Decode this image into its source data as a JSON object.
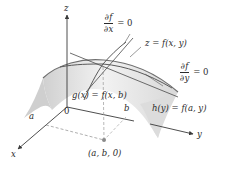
{
  "figure": {
    "axes": {
      "x_label": "x",
      "y_label": "y",
      "z_label": "z",
      "origin_label": "0",
      "a_label": "a",
      "b_label": "b"
    },
    "labels": {
      "dfdx_num": "∂f",
      "dfdx_den": "∂x",
      "dfdx_eq": "= 0",
      "dfdy_num": "∂f",
      "dfdy_den": "∂y",
      "dfdy_eq": "= 0",
      "surface": "z = f(x, y)",
      "g_trace": "g(x) = f(x, b)",
      "h_trace": "h(y) = f(a, y)",
      "point": "(a, b, 0)"
    },
    "colors": {
      "surface_fill": "#e2e2e2",
      "surface_edge": "#6f6f6f",
      "curve": "#5a5a5a",
      "axis": "#3a3a3a",
      "dashed": "#9a9a9a",
      "point": "#8a8a8a",
      "text": "#2a2a2a"
    }
  }
}
